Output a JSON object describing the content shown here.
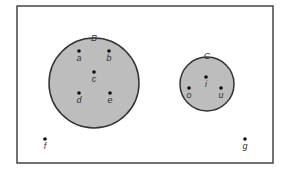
{
  "diagram": {
    "type": "venn",
    "universe": {
      "x": 17,
      "y": 6,
      "width": 256,
      "height": 157,
      "stroke": "#444444",
      "elements_outside": [
        {
          "label": "f",
          "x": 45,
          "y": 139
        },
        {
          "label": "g",
          "x": 245,
          "y": 139
        }
      ]
    },
    "sets": [
      {
        "label": "B",
        "cx": 94,
        "cy": 83,
        "r": 45,
        "fill": "#bdbdbd",
        "stroke": "#333333",
        "label_x": 94,
        "label_y": 41,
        "elements": [
          {
            "label": "a",
            "x": 79,
            "y": 51
          },
          {
            "label": "b",
            "x": 109,
            "y": 51
          },
          {
            "label": "c",
            "x": 94,
            "y": 72
          },
          {
            "label": "d",
            "x": 79,
            "y": 93
          },
          {
            "label": "e",
            "x": 110,
            "y": 93
          }
        ]
      },
      {
        "label": "C",
        "cx": 207,
        "cy": 84,
        "r": 27,
        "fill": "#bdbdbd",
        "stroke": "#333333",
        "label_x": 207,
        "label_y": 59,
        "elements": [
          {
            "label": "i",
            "x": 206,
            "y": 77
          },
          {
            "label": "o",
            "x": 189,
            "y": 88
          },
          {
            "label": "u",
            "x": 221,
            "y": 88
          }
        ]
      }
    ]
  }
}
